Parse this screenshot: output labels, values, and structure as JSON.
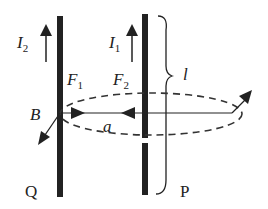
{
  "diagram": {
    "type": "physics-parallel-current-wires",
    "wires": [
      {
        "name": "Q",
        "current_label": "I",
        "current_sub": "2",
        "force_label": "F",
        "force_sub": "1"
      },
      {
        "name": "P",
        "current_label": "I",
        "current_sub": "1",
        "force_label": "F",
        "force_sub": "2"
      }
    ],
    "labels": {
      "field": "B",
      "separation": "a",
      "length": "l",
      "wire_q": "Q",
      "wire_p": "P"
    },
    "colors": {
      "ink": "#222222",
      "background": "#ffffff"
    }
  }
}
